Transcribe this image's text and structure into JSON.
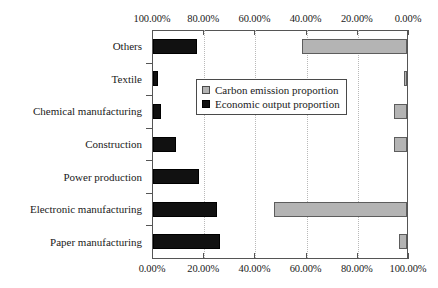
{
  "chart_data": {
    "type": "bar",
    "orientation": "horizontal",
    "layout": "bidirectional-paired",
    "title": "",
    "xlabel": "",
    "ylabel": "",
    "grid": true,
    "legend_position": "center",
    "categories": [
      "Others",
      "Textile",
      "Chemical manufacturing",
      "Construction",
      "Power production",
      "Electronic manufacturing",
      "Paper manufacturing"
    ],
    "series": [
      {
        "name": "Carbon emission proportion",
        "color": "#b4b4b4",
        "axis": "top",
        "axis_direction": "right-to-left",
        "axis_ticks": [
          "100.00%",
          "80.00%",
          "60.00%",
          "40.00%",
          "20.00%",
          "0.00%"
        ],
        "axis_tick_values": [
          100,
          80,
          60,
          40,
          20,
          0
        ],
        "xlim": [
          0,
          100
        ],
        "values": [
          41,
          1,
          5,
          5,
          0,
          52,
          3
        ]
      },
      {
        "name": "Economic output proportion",
        "color": "#111111",
        "axis": "bottom",
        "axis_direction": "left-to-right",
        "axis_ticks": [
          "0.00%",
          "20.00%",
          "40.00%",
          "60.00%",
          "80.00%",
          "100.00%"
        ],
        "axis_tick_values": [
          0,
          20,
          40,
          60,
          80,
          100
        ],
        "xlim": [
          0,
          100
        ],
        "values": [
          17,
          2,
          3,
          9,
          18,
          25,
          26
        ]
      }
    ]
  },
  "legend": {
    "items": [
      {
        "label": "Carbon emission proportion",
        "swatch": "carbon-swatch-icon"
      },
      {
        "label": "Economic output proportion",
        "swatch": "economic-swatch-icon"
      }
    ]
  }
}
